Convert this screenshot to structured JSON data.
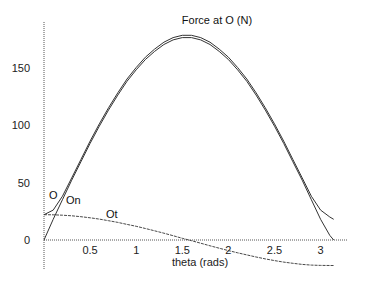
{
  "chart_data": {
    "type": "line",
    "title": "Force at O (N)",
    "xlabel": "theta (rads)",
    "ylabel": "",
    "xlim": [
      0,
      3.1416
    ],
    "ylim": [
      -22,
      180
    ],
    "grid": false,
    "legend": "inline curve labels",
    "x_ticks": [
      "0.5",
      "1",
      "1.5",
      "2",
      "2.5",
      "3"
    ],
    "y_ticks": [
      "0",
      "50",
      "100",
      "150"
    ],
    "x": [
      0,
      0.1,
      0.2,
      0.3,
      0.4,
      0.5,
      0.6,
      0.7,
      0.8,
      0.9,
      1.0,
      1.1,
      1.2,
      1.3,
      1.4,
      1.5,
      1.6,
      1.7,
      1.8,
      1.9,
      2.0,
      2.1,
      2.2,
      2.3,
      2.4,
      2.5,
      2.6,
      2.7,
      2.8,
      2.9,
      3.0,
      3.1,
      3.1416
    ],
    "series": [
      {
        "name": "O",
        "values": [
          22,
          26,
          38,
          54,
          70,
          86,
          101,
          115,
          128,
          140,
          150,
          159,
          166,
          172,
          176,
          178,
          178,
          176,
          172,
          166,
          159,
          150,
          140,
          128,
          115,
          101,
          86,
          70,
          54,
          38,
          26,
          20,
          18
        ]
      },
      {
        "name": "On",
        "values": [
          0,
          18,
          35,
          52,
          68,
          84,
          99,
          113,
          126,
          138,
          148,
          157,
          164,
          170,
          174,
          176,
          176,
          174,
          170,
          164,
          157,
          148,
          138,
          126,
          113,
          99,
          84,
          68,
          52,
          35,
          18,
          4,
          0
        ]
      },
      {
        "name": "Ot",
        "values": [
          22,
          21.9,
          21.6,
          21,
          20.3,
          19.3,
          18.2,
          16.8,
          15.3,
          13.6,
          11.9,
          10,
          8,
          5.9,
          3.7,
          1.5,
          -0.6,
          -2.8,
          -5,
          -7.1,
          -9.2,
          -11.1,
          -13,
          -14.8,
          -16.4,
          -17.9,
          -19.2,
          -20.3,
          -21.2,
          -21.8,
          -22.1,
          -22.2,
          -22.2
        ]
      }
    ],
    "labels": {
      "O": "O",
      "On": "On",
      "Ot": "Ot"
    }
  }
}
